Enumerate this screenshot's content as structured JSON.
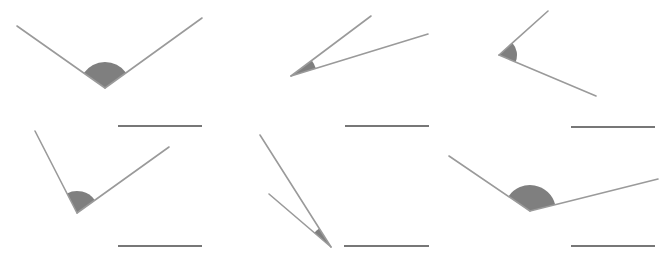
{
  "colors": {
    "ray": "#9a9a9a",
    "wedge": "#7f7f7f",
    "answer_line": "#4a4a4a",
    "background": "#ffffff"
  },
  "angles": [
    {
      "id": 1,
      "vertex": [
        105,
        88
      ],
      "ray_a_end": [
        17,
        26
      ],
      "ray_b_end": [
        202,
        18
      ],
      "arc_radius": 26,
      "answer_line": [
        [
          118,
          126
        ],
        [
          202,
          126
        ]
      ]
    },
    {
      "id": 2,
      "vertex": [
        291,
        76
      ],
      "ray_a_end": [
        371,
        16
      ],
      "ray_b_end": [
        428,
        34
      ],
      "arc_radius": 26,
      "answer_line": [
        [
          345,
          126
        ],
        [
          429,
          126
        ]
      ]
    },
    {
      "id": 3,
      "vertex": [
        499,
        55
      ],
      "ray_a_end": [
        548,
        11
      ],
      "ray_b_end": [
        596,
        96
      ],
      "arc_radius": 18,
      "answer_line": [
        [
          571,
          127
        ],
        [
          655,
          127
        ]
      ]
    },
    {
      "id": 4,
      "vertex": [
        77,
        213
      ],
      "ray_a_end": [
        35,
        131
      ],
      "ray_b_end": [
        169,
        147
      ],
      "arc_radius": 22,
      "answer_line": [
        [
          118,
          246
        ],
        [
          202,
          246
        ]
      ]
    },
    {
      "id": 5,
      "vertex": [
        331,
        247
      ],
      "ray_a_end": [
        260,
        135
      ],
      "ray_b_end": [
        269,
        194
      ],
      "arc_radius": 22,
      "answer_line": [
        [
          344,
          246
        ],
        [
          429,
          246
        ]
      ]
    },
    {
      "id": 6,
      "vertex": [
        530,
        211
      ],
      "ray_a_end": [
        449,
        156
      ],
      "ray_b_end": [
        658,
        179
      ],
      "arc_radius": 26,
      "answer_line": [
        [
          571,
          246
        ],
        [
          655,
          246
        ]
      ]
    }
  ]
}
